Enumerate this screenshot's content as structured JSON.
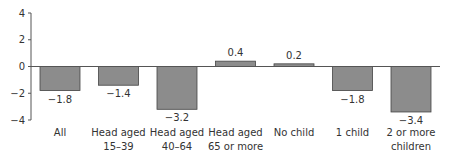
{
  "chart_data": {
    "type": "bar",
    "title": "",
    "xlabel": "",
    "ylabel": "",
    "ylim": [
      -4,
      4
    ],
    "yticks": [
      4,
      2,
      0,
      -2,
      -4
    ],
    "ytick_labels": [
      "4",
      "2",
      "0",
      "−2",
      "−4"
    ],
    "grid": false,
    "legend": "none",
    "categories": [
      [
        "All"
      ],
      [
        "Head aged",
        "15–39"
      ],
      [
        "Head aged",
        "40–64"
      ],
      [
        "Head aged",
        "65 or more"
      ],
      [
        "No child"
      ],
      [
        "1 child"
      ],
      [
        "2 or more",
        "children"
      ]
    ],
    "values": [
      -1.8,
      -1.4,
      -3.2,
      0.4,
      0.2,
      -1.8,
      -3.4
    ],
    "value_labels": [
      "−1.8",
      "−1.4",
      "−3.2",
      "0.4",
      "0.2",
      "−1.8",
      "−3.4"
    ],
    "bar_color": "#8c8c8c"
  }
}
